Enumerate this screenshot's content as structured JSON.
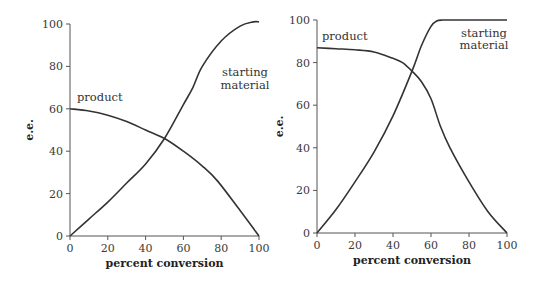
{
  "chart_data": [
    {
      "type": "line",
      "title": "",
      "xlabel": "percent conversion",
      "ylabel": "e.e.",
      "xlim": [
        0,
        100
      ],
      "ylim": [
        0,
        100
      ],
      "xticks": [
        0,
        20,
        40,
        60,
        80,
        100
      ],
      "yticks": [
        0,
        20,
        40,
        60,
        80,
        100
      ],
      "grid": false,
      "legend": "inline labels",
      "series": [
        {
          "name": "product",
          "x": [
            0,
            10,
            20,
            30,
            40,
            50,
            60,
            70,
            78,
            90,
            100
          ],
          "values": [
            60,
            59,
            57,
            54,
            50,
            46,
            40,
            33,
            26,
            12,
            0
          ]
        },
        {
          "name": "starting material",
          "x": [
            0,
            10,
            20,
            30,
            40,
            50,
            60,
            65,
            70,
            80,
            90,
            97,
            100
          ],
          "values": [
            0,
            8,
            16,
            25,
            34,
            46,
            62,
            70,
            80,
            92,
            99,
            101,
            101
          ]
        }
      ],
      "annotations": [
        "product",
        "starting",
        "material"
      ]
    },
    {
      "type": "line",
      "title": "",
      "xlabel": "percent conversion",
      "ylabel": "e.e.",
      "xlim": [
        0,
        100
      ],
      "ylim": [
        0,
        100
      ],
      "xticks": [
        0,
        20,
        40,
        60,
        80,
        100
      ],
      "yticks": [
        0,
        20,
        40,
        60,
        80,
        100
      ],
      "grid": false,
      "legend": "inline labels",
      "series": [
        {
          "name": "product",
          "x": [
            0,
            10,
            20,
            30,
            40,
            45,
            50,
            55,
            60,
            65,
            70,
            80,
            90,
            100
          ],
          "values": [
            87,
            86.5,
            86,
            85,
            82,
            80,
            76,
            71,
            63,
            50,
            40,
            24,
            10,
            0
          ]
        },
        {
          "name": "starting material",
          "x": [
            0,
            10,
            20,
            30,
            40,
            50,
            55,
            60,
            63,
            66,
            70,
            80,
            100
          ],
          "values": [
            0,
            11,
            24,
            38,
            55,
            76,
            88,
            97,
            99.5,
            100,
            100,
            100,
            100
          ]
        }
      ],
      "annotations": [
        "product",
        "starting",
        "material"
      ]
    }
  ],
  "charts": [
    {
      "ylabel": "e.e.",
      "xlabel": "percent conversion",
      "xtick_labels": [
        "0",
        "20",
        "40",
        "60",
        "80",
        "100"
      ],
      "ytick_labels": [
        "0",
        "20",
        "40",
        "60",
        "80",
        "100"
      ],
      "label_product": "product",
      "label_sm_1": "starting",
      "label_sm_2": "material"
    },
    {
      "ylabel": "e.e.",
      "xlabel": "percent conversion",
      "xtick_labels": [
        "0",
        "20",
        "40",
        "60",
        "80",
        "100"
      ],
      "ytick_labels": [
        "0",
        "20",
        "40",
        "60",
        "80",
        "100"
      ],
      "label_product": "product",
      "label_sm_1": "starting",
      "label_sm_2": "material"
    }
  ]
}
